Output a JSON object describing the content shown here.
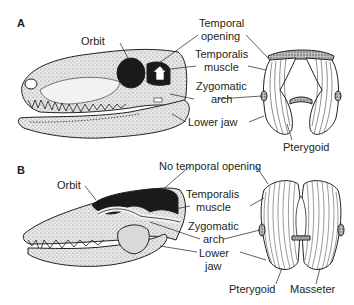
{
  "panels": [
    {
      "letter": "A",
      "labels": {
        "orbit": "Orbit",
        "temporal_opening_1": "Temporal",
        "temporal_opening_2": "opening",
        "temporalis_1": "Temporalis",
        "temporalis_2": "muscle",
        "zygomatic_1": "Zygomatic",
        "zygomatic_2": "arch",
        "lower_jaw": "Lower jaw",
        "pterygoid": "Pterygoid"
      }
    },
    {
      "letter": "B",
      "labels": {
        "orbit": "Orbit",
        "no_temporal_opening": "No temporal opening",
        "temporalis_1": "Temporalis",
        "temporalis_2": "muscle",
        "zygomatic_1": "Zygomatic",
        "zygomatic_2": "arch",
        "lower_jaw_1": "Lower",
        "lower_jaw_2": "jaw",
        "pterygoid": "Pterygoid",
        "masseter": "Masseter"
      }
    }
  ],
  "colors": {
    "ink": "#231f20",
    "bone": "#e6e6e6",
    "dark": "#1a1a1a",
    "background": "#ffffff"
  }
}
